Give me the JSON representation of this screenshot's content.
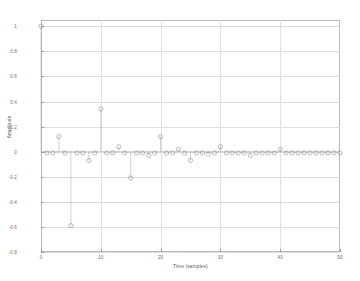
{
  "chart_data": {
    "type": "line",
    "subtype": "stem",
    "title": "",
    "xlabel": "Time (samples)",
    "ylabel": "Amplitude",
    "xlim": [
      0,
      50
    ],
    "ylim": [
      -0.8,
      1.05
    ],
    "grid": true,
    "legend": null,
    "xticks": [
      0,
      10,
      20,
      30,
      40,
      50
    ],
    "xtick_labels": [
      "0",
      "10",
      "20",
      "30",
      "40",
      "50"
    ],
    "yticks": [
      1,
      0.8,
      0.6,
      0.4,
      0.2,
      0,
      -0.2,
      -0.4,
      -0.6,
      -0.8
    ],
    "ytick_labels": [
      "1",
      "0.8",
      "0.6",
      "0.4",
      "0.2",
      "0",
      "-0.2",
      "-0.4",
      "-0.6",
      "-0.8"
    ],
    "marker": "open-circle",
    "series": [
      {
        "name": "impulse response",
        "x": [
          0,
          1,
          2,
          3,
          4,
          5,
          6,
          7,
          8,
          9,
          10,
          11,
          12,
          13,
          14,
          15,
          16,
          17,
          18,
          19,
          20,
          21,
          22,
          23,
          24,
          25,
          26,
          27,
          28,
          29,
          30,
          31,
          32,
          33,
          34,
          35,
          36,
          37,
          38,
          39,
          40,
          41,
          42,
          43,
          44,
          45,
          46,
          47,
          48,
          49,
          50
        ],
        "values": [
          1.0,
          -0.01,
          -0.01,
          0.12,
          -0.01,
          -0.59,
          -0.01,
          -0.01,
          -0.07,
          -0.01,
          0.34,
          -0.01,
          -0.01,
          0.04,
          -0.01,
          -0.21,
          -0.01,
          -0.01,
          -0.03,
          -0.01,
          0.12,
          -0.01,
          -0.01,
          0.02,
          -0.01,
          -0.07,
          -0.01,
          -0.01,
          -0.02,
          -0.01,
          0.04,
          -0.01,
          -0.01,
          -0.01,
          -0.01,
          -0.03,
          -0.01,
          -0.01,
          -0.01,
          -0.01,
          0.02,
          -0.01,
          -0.01,
          -0.01,
          -0.01,
          -0.01,
          -0.01,
          -0.01,
          -0.01,
          -0.01,
          -0.01
        ]
      }
    ]
  },
  "figure": {
    "background_color": "#ffffff",
    "grid_color": "#dcdcdc",
    "axis_color": "#b9b9b9",
    "marker_color": "#8f8f8f",
    "stem_color": "#a8a8a8",
    "text_color": "#5a5a5a"
  }
}
